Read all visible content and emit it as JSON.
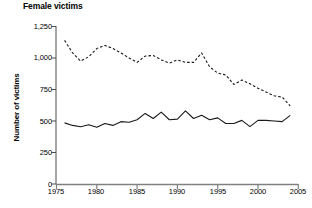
{
  "chart_data": {
    "type": "line",
    "title": "Female victims",
    "xlabel": "",
    "ylabel": "Number of victims",
    "xlim": [
      1975,
      2005
    ],
    "ylim": [
      0,
      1250
    ],
    "grid": false,
    "legend": "none",
    "y_ticks": [
      0,
      250,
      500,
      750,
      1000,
      1250
    ],
    "y_tick_labels": [
      "0",
      "250",
      "500",
      "750",
      "1,000",
      "1,250"
    ],
    "x_ticks": [
      1975,
      1980,
      1985,
      1990,
      1995,
      2000,
      2005
    ],
    "x_tick_labels": [
      "1975",
      "1980",
      "1985",
      "1990",
      "1995",
      "2000",
      "2005"
    ],
    "x": [
      1976,
      1977,
      1978,
      1979,
      1980,
      1981,
      1982,
      1983,
      1984,
      1985,
      1986,
      1987,
      1988,
      1989,
      1990,
      1991,
      1992,
      1993,
      1994,
      1995,
      1996,
      1997,
      1998,
      1999,
      2000,
      2001,
      2002,
      2003,
      2004
    ],
    "series": [
      {
        "name": "Intimate partner victims",
        "style": "dashed",
        "color": "#1a1a1a",
        "values": [
          1140,
          1040,
          975,
          1010,
          1075,
          1100,
          1075,
          1040,
          1000,
          965,
          1015,
          1020,
          985,
          960,
          985,
          965,
          965,
          1040,
          930,
          880,
          865,
          790,
          825,
          795,
          760,
          730,
          700,
          690,
          620
        ]
      },
      {
        "name": "Other victims",
        "style": "solid",
        "color": "#1a1a1a",
        "values": [
          485,
          465,
          455,
          470,
          450,
          480,
          465,
          495,
          490,
          510,
          560,
          520,
          570,
          510,
          515,
          580,
          520,
          545,
          510,
          525,
          480,
          480,
          505,
          455,
          505,
          505,
          500,
          495,
          545
        ]
      }
    ]
  }
}
